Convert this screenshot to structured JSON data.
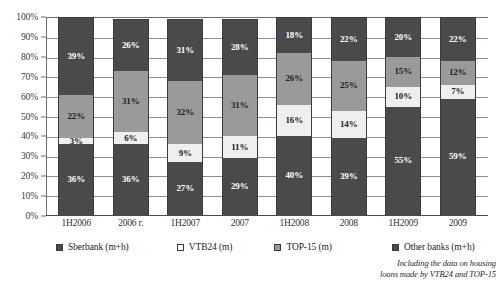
{
  "chart_data": {
    "type": "bar",
    "subtype": "stacked-bar-100-percent",
    "title": "",
    "xlabel": "",
    "ylabel": "",
    "ylim": [
      0,
      100
    ],
    "y_unit": "%",
    "grid": true,
    "legend_position": "bottom",
    "categories": [
      "1H2006",
      "2006 г.",
      "1H2007",
      "2007",
      "1H2008",
      "2008",
      "1H2009",
      "2009"
    ],
    "y_ticks": [
      "0%",
      "10%",
      "20%",
      "30%",
      "40%",
      "50%",
      "60%",
      "70%",
      "80%",
      "90%",
      "100%"
    ],
    "series": [
      {
        "name": "Sberbank (m+h)",
        "color": "#4a4a4a",
        "values": [
          36,
          36,
          27,
          29,
          40,
          39,
          55,
          59
        ],
        "labels": [
          "36%",
          "36%",
          "27%",
          "29%",
          "40%",
          "39%",
          "55%",
          "59%"
        ]
      },
      {
        "name": "VTB24 (m)",
        "color": "#efefef",
        "values": [
          3,
          6,
          9,
          11,
          16,
          14,
          10,
          7
        ],
        "labels": [
          "3%",
          "6%",
          "9%",
          "11%",
          "16%",
          "14%",
          "10%",
          "7%"
        ]
      },
      {
        "name": "TOP-15 (m)",
        "color": "#9a9a9a",
        "values": [
          22,
          31,
          32,
          31,
          26,
          25,
          15,
          12
        ],
        "labels": [
          "22%",
          "31%",
          "32%",
          "31%",
          "26%",
          "25%",
          "15%",
          "12%"
        ]
      },
      {
        "name": "Other banks (m+h)",
        "color": "#4a4a4a",
        "values": [
          39,
          26,
          31,
          28,
          18,
          22,
          20,
          22
        ],
        "labels": [
          "39%",
          "26%",
          "31%",
          "28%",
          "18%",
          "22%",
          "20%",
          "22%"
        ]
      }
    ],
    "annotations": [
      "Including the data on housing",
      "loans made by VTB24 and TOP-15"
    ]
  },
  "legend": {
    "items": [
      {
        "label": "Sberbank (m+h)",
        "swatch": "dark"
      },
      {
        "label": "VTB24 (m)",
        "swatch": "light"
      },
      {
        "label": "TOP-15 (m)",
        "swatch": "mid"
      },
      {
        "label": "Other banks (m+h)",
        "swatch": "dark"
      }
    ]
  },
  "footnote": {
    "line1": "Including the data on housing",
    "line2": "loans made by VTB24 and TOP-15"
  }
}
